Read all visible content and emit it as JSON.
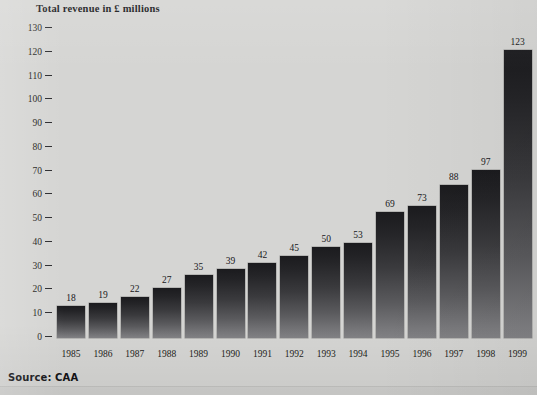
{
  "chart_data": {
    "type": "bar",
    "title": "Total revenue in £ millions",
    "xlabel": "",
    "ylabel": "",
    "ylim": [
      0,
      130
    ],
    "ytick_step": 10,
    "grid": false,
    "legend": "none",
    "source": "Source: CAA",
    "categories": [
      "1985",
      "1986",
      "1987",
      "1988",
      "1989",
      "1990",
      "1991",
      "1992",
      "1993",
      "1994",
      "1995",
      "1996",
      "1997",
      "1998",
      "1999"
    ],
    "values": [
      18,
      19,
      22,
      27,
      35,
      39,
      42,
      45,
      50,
      53,
      69,
      73,
      88,
      97,
      123
    ],
    "value_labels": [
      "18",
      "19",
      "22",
      "27",
      "35",
      "39",
      "42",
      "45",
      "50",
      "53",
      "69",
      "73",
      "88",
      "97",
      "123"
    ],
    "yticks": [
      "130",
      "120",
      "110",
      "100",
      "90",
      "80",
      "70",
      "60",
      "50",
      "40",
      "30",
      "20",
      "10",
      "0"
    ],
    "bar_pixel_tops": [
      306,
      303,
      297,
      288,
      275,
      269,
      263,
      256,
      247,
      243,
      212,
      206,
      185,
      170,
      50
    ],
    "colors": {
      "background": "#d5d5d3",
      "bar_top": "#1b1b1e",
      "bar_bottom": "#828285",
      "text": "#17171a"
    }
  }
}
